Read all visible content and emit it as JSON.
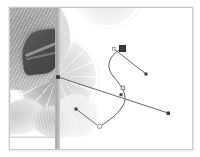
{
  "app": {
    "document_title": "Untitled",
    "tool": "direct-selection-tool",
    "canvas": {
      "width": 182,
      "height": 141,
      "background": "#ffffff"
    }
  },
  "artwork": {
    "photo": {
      "subject": "grapefruit and citrus slices",
      "palette": [
        "#2e2e2e",
        "#8d8d8d",
        "#ababab",
        "#cfcfcf",
        "#f2f2f2",
        "#ffffff"
      ],
      "placed_image_clip": {
        "x": 0,
        "y": 0,
        "width": 47,
        "height": 129
      },
      "faded_opacity": "0.42"
    },
    "guide": {
      "name": "vertical-guide",
      "x": 45,
      "color": "#b0b0b0",
      "width": 5
    }
  },
  "vector_path": {
    "type": "bezier-path",
    "stroke_color": "#555555",
    "stroke_width": 1,
    "segments": [
      {
        "d": "M 113 40 C 101 48, 97 58, 104 68 C 112 80, 118 88, 112 98 C 106 108, 98 112, 92 116"
      }
    ],
    "anchor_points": [
      {
        "name": "anchor-selected",
        "shape": "square-filled",
        "x": 122,
        "y": 49,
        "size": 6,
        "fill": "#3b3b3b",
        "selected": true
      },
      {
        "name": "anchor-mid",
        "shape": "square-hollow",
        "x": 112,
        "y": 86,
        "size": 4,
        "fill": "#ffffff",
        "stroke": "#777777",
        "selected": false
      },
      {
        "name": "anchor-end",
        "shape": "circle-hollow",
        "x": 95,
        "y": 124,
        "size": 4,
        "fill": "#ffffff",
        "stroke": "#888888",
        "selected": false
      },
      {
        "name": "anchor-left",
        "shape": "square-filled",
        "x": 57,
        "y": 76,
        "size": 4,
        "fill": "#3b3b3b",
        "selected": false
      }
    ],
    "control_handles": [
      {
        "name": "handle-top",
        "from_x": 113,
        "from_y": 42,
        "to_x": 145,
        "to_y": 66,
        "endpoint": "square-filled"
      },
      {
        "name": "handle-long-diagonal",
        "from_x": 57,
        "from_y": 76,
        "to_x": 166,
        "to_y": 112,
        "endpoint": "square-filled"
      },
      {
        "name": "handle-bottom-left",
        "from_x": 74,
        "from_y": 108,
        "to_x": 95,
        "to_y": 124,
        "endpoint": "circle-hollow"
      }
    ]
  }
}
